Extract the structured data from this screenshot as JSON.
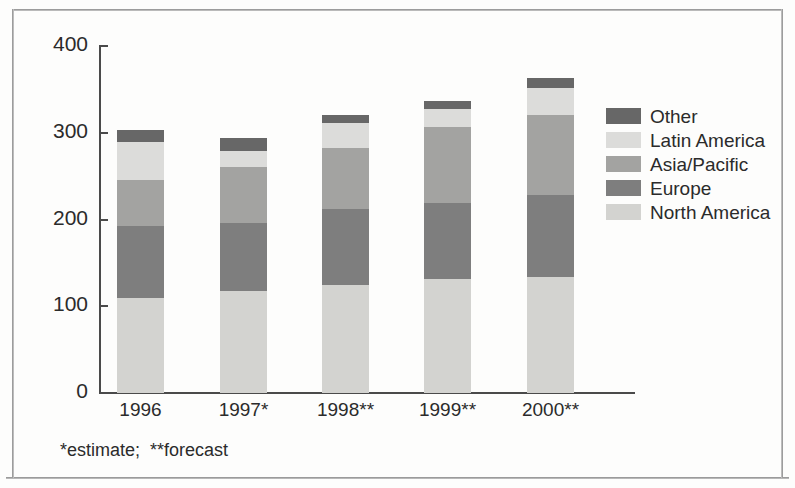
{
  "chart_data": {
    "type": "bar",
    "subtype": "stacked-bar",
    "title": "",
    "xlabel": "",
    "ylabel": "",
    "categories": [
      "1996",
      "1997*",
      "1998**",
      "1999**",
      "2000**"
    ],
    "series": [
      {
        "name": "North America",
        "color": "#d3d3d0",
        "values": [
          110,
          118,
          124,
          131,
          134
        ]
      },
      {
        "name": "Europe",
        "color": "#7e7e7e",
        "values": [
          82,
          78,
          88,
          88,
          94
        ]
      },
      {
        "name": "Asia/Pacific",
        "color": "#a3a3a1",
        "values": [
          54,
          64,
          70,
          88,
          92
        ]
      },
      {
        "name": "Latin America",
        "color": "#dcdcda",
        "values": [
          43,
          19,
          29,
          20,
          32
        ]
      },
      {
        "name": "Other",
        "color": "#676767",
        "values": [
          14,
          15,
          9,
          10,
          11
        ]
      }
    ],
    "totals": [
      291,
      301,
      320,
      337,
      363
    ],
    "stack_order_bottom_to_top": [
      "North America",
      "Europe",
      "Asia/Pacific",
      "Latin America",
      "Other"
    ],
    "ylim": [
      0,
      400
    ],
    "yticks": [
      0,
      100,
      200,
      300,
      400
    ],
    "ytick_labels": [
      "0",
      "100",
      "200",
      "300",
      "400"
    ],
    "grid": false,
    "legend_position": "right",
    "legend_order_top_to_bottom": [
      "Other",
      "Latin America",
      "Asia/Pacific",
      "Europe",
      "North America"
    ],
    "footnote": "*estimate;  **forecast"
  },
  "axis": {
    "y_tick_labels": [
      "400",
      "300",
      "200",
      "100",
      "0"
    ],
    "x_tick_labels": [
      "1996",
      "1997*",
      "1998**",
      "1999**",
      "2000**"
    ]
  },
  "legend": {
    "items": [
      {
        "label": "Other",
        "color": "#676767"
      },
      {
        "label": "Latin America",
        "color": "#dcdcda"
      },
      {
        "label": "Asia/Pacific",
        "color": "#a3a3a1"
      },
      {
        "label": "Europe",
        "color": "#7e7e7e"
      },
      {
        "label": "North America",
        "color": "#d3d3d0"
      }
    ]
  },
  "footnote": {
    "text": "*estimate;  **forecast"
  }
}
